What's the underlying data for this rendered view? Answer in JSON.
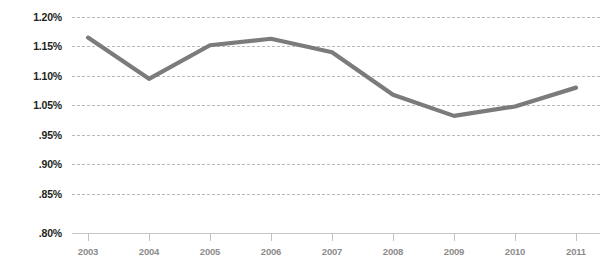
{
  "chart_data": {
    "type": "line",
    "title": "",
    "subtitle": "",
    "xlabel": "",
    "ylabel": "",
    "categories": [
      "2003",
      "2004",
      "2005",
      "2006",
      "2007",
      "2008",
      "2009",
      "2010",
      "2011"
    ],
    "x": [
      2003,
      2004,
      2005,
      2006,
      2007,
      2008,
      2009,
      2010,
      2011
    ],
    "series": [
      {
        "name": "",
        "color": "#7b7b7b",
        "values": [
          1.165,
          1.095,
          1.152,
          1.163,
          1.14,
          1.068,
          1.032,
          1.048,
          1.08
        ]
      }
    ],
    "values": [
      1.165,
      1.095,
      1.152,
      1.163,
      1.14,
      1.068,
      1.032,
      1.048,
      1.08
    ],
    "y_tick_labels": [
      "1.20%",
      "1.15%",
      "1.10%",
      "1.05%",
      ".95%",
      ".90%",
      ".85%",
      ".80%"
    ],
    "y_tick_values": [
      1.2,
      1.15,
      1.1,
      1.05,
      0.95,
      0.9,
      0.85,
      0.8
    ],
    "x_tick_labels": [
      "2003",
      "2004",
      "2005",
      "2006",
      "2007",
      "2008",
      "2009",
      "2010",
      "2011"
    ],
    "ylim": [
      0.8,
      1.2
    ],
    "xlim": [
      2003,
      2011
    ],
    "grid": true,
    "grid_style": "dashed-horizontal",
    "legend": "none",
    "annotations": [],
    "units": "percent"
  },
  "axes": {
    "y_labels": [
      {
        "text": "1.20%"
      },
      {
        "text": "1.15%"
      },
      {
        "text": "1.10%"
      },
      {
        "text": "1.05%"
      },
      {
        "text": ".95%"
      },
      {
        "text": ".90%"
      },
      {
        "text": ".85%"
      },
      {
        "text": ".80%"
      }
    ],
    "x_labels": [
      {
        "text": "2003"
      },
      {
        "text": "2004"
      },
      {
        "text": "2005"
      },
      {
        "text": "2006"
      },
      {
        "text": "2007"
      },
      {
        "text": "2008"
      },
      {
        "text": "2009"
      },
      {
        "text": "2010"
      },
      {
        "text": "2011"
      }
    ]
  },
  "style": {
    "line_color": "#7b7b7b",
    "grid_color": "#b9b9b9",
    "axis_color": "#c7c7c7",
    "y_label_color": "#231f20",
    "x_label_color": "#8c8c8c",
    "background": "#ffffff"
  }
}
